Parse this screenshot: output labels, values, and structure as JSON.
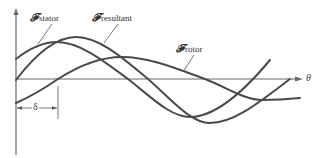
{
  "diagram": {
    "axis": {
      "horizontal_label": "θ",
      "origin_x": 16,
      "baseline_y": 79
    },
    "labels": {
      "stator": {
        "symbol": "𝓕",
        "subscript": "stator"
      },
      "resultant": {
        "symbol": "𝓕",
        "subscript": "resultant"
      },
      "rotor": {
        "symbol": "𝓕",
        "subscript": "rotor"
      }
    },
    "angle_marker": {
      "symbol": "δ",
      "from_x": 16,
      "to_x": 58
    },
    "colors": {
      "curve": "#4a4a4a",
      "axis": "#6a6a6a",
      "background": "#ffffff"
    }
  }
}
